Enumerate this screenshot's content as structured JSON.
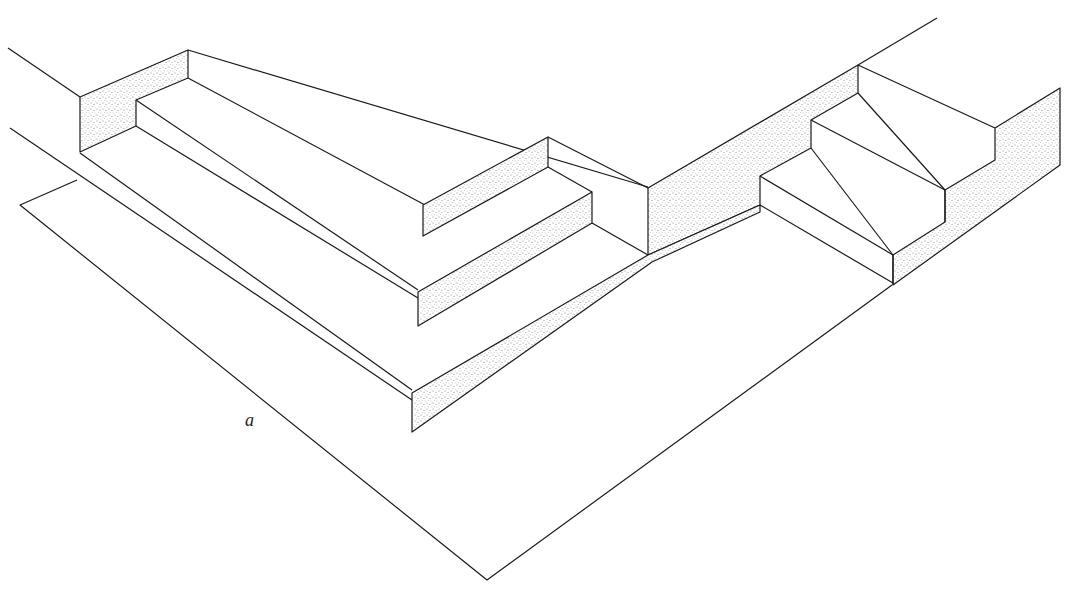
{
  "figure": {
    "label": "a",
    "colors": {
      "line": "#1a1a1a",
      "stipple": "#8a8a8a",
      "background": "#ffffff"
    }
  }
}
